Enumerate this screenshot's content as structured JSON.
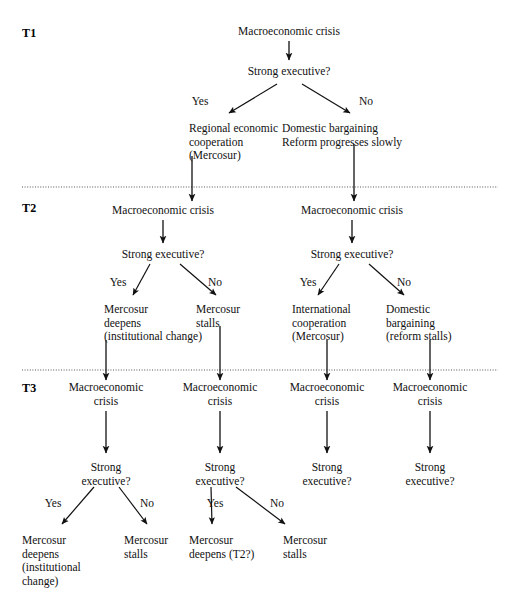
{
  "figure": {
    "type": "decision-tree",
    "title": "",
    "background": "#ffffff",
    "ink": "#111111",
    "divider_color": "#555555"
  },
  "periods": [
    {
      "label": "T1",
      "x": 22,
      "y": 26
    },
    {
      "label": "T2",
      "x": 22,
      "y": 201
    },
    {
      "label": "T3",
      "x": 22,
      "y": 381
    }
  ],
  "dividers": [
    {
      "name": "divider-t1-t2",
      "y": 187
    },
    {
      "name": "divider-t2-t3",
      "y": 370
    }
  ],
  "nodes": [
    {
      "id": "t1-crisis",
      "text": "Macroeconomic crisis",
      "x": 289,
      "y": 25,
      "align": "center"
    },
    {
      "id": "t1-question",
      "text": "Strong executive?",
      "x": 289,
      "y": 65,
      "align": "center"
    },
    {
      "id": "t1-yes-out",
      "text": "Regional economic\ncooperation\n(Mercosur)",
      "x": 189,
      "y": 122,
      "align": "left"
    },
    {
      "id": "t1-no-out",
      "text": "Domestic bargaining\nReform progresses slowly",
      "x": 282,
      "y": 122,
      "align": "left"
    },
    {
      "id": "t2-crisis-l",
      "text": "Macroeconomic crisis",
      "x": 163,
      "y": 204,
      "align": "center"
    },
    {
      "id": "t2-crisis-r",
      "text": "Macroeconomic crisis",
      "x": 352,
      "y": 204,
      "align": "center"
    },
    {
      "id": "t2-question-l",
      "text": "Strong executive?",
      "x": 163,
      "y": 248,
      "align": "center"
    },
    {
      "id": "t2-question-r",
      "text": "Strong executive?",
      "x": 352,
      "y": 248,
      "align": "center"
    },
    {
      "id": "t2-out-ll",
      "text": "Mercosur\ndeepens\n(institutional change)",
      "x": 104,
      "y": 303,
      "align": "left"
    },
    {
      "id": "t2-out-lr",
      "text": "Mercosur\nstalls",
      "x": 196,
      "y": 303,
      "align": "left"
    },
    {
      "id": "t2-out-rl",
      "text": "International\ncooperation\n(Mercosur)",
      "x": 292,
      "y": 303,
      "align": "left"
    },
    {
      "id": "t2-out-rr",
      "text": "Domestic\nbargaining\n(reform stalls)",
      "x": 386,
      "y": 303,
      "align": "left"
    },
    {
      "id": "t3-crisis-1",
      "text": "Macroeconomic\ncrisis",
      "x": 106,
      "y": 381,
      "align": "center"
    },
    {
      "id": "t3-crisis-2",
      "text": "Macroeconomic\ncrisis",
      "x": 220,
      "y": 381,
      "align": "center"
    },
    {
      "id": "t3-crisis-3",
      "text": "Macroeconomic\ncrisis",
      "x": 327,
      "y": 381,
      "align": "center"
    },
    {
      "id": "t3-crisis-4",
      "text": "Macroeconomic\ncrisis",
      "x": 430,
      "y": 381,
      "align": "center"
    },
    {
      "id": "t3-question-1",
      "text": "Strong\nexecutive?",
      "x": 106,
      "y": 461,
      "align": "center"
    },
    {
      "id": "t3-question-2",
      "text": "Strong\nexecutive?",
      "x": 220,
      "y": 461,
      "align": "center"
    },
    {
      "id": "t3-question-3",
      "text": "Strong\nexecutive?",
      "x": 327,
      "y": 461,
      "align": "center"
    },
    {
      "id": "t3-question-4",
      "text": "Strong\nexecutive?",
      "x": 430,
      "y": 461,
      "align": "center"
    },
    {
      "id": "t3-out-1",
      "text": "Mercosur\ndeepens\n(institutional\nchange)",
      "x": 22,
      "y": 534,
      "align": "left"
    },
    {
      "id": "t3-out-2",
      "text": "Mercosur\nstalls",
      "x": 124,
      "y": 534,
      "align": "left"
    },
    {
      "id": "t3-out-3",
      "text": "Mercosur\ndeepens (T2?)",
      "x": 189,
      "y": 534,
      "align": "left"
    },
    {
      "id": "t3-out-4",
      "text": "Mercosur\nstalls",
      "x": 283,
      "y": 534,
      "align": "left"
    }
  ],
  "branch_labels": [
    {
      "id": "t1-yes",
      "text": "Yes",
      "x": 200,
      "y": 95
    },
    {
      "id": "t1-no",
      "text": "No",
      "x": 366,
      "y": 95
    },
    {
      "id": "t2-yes-l",
      "text": "Yes",
      "x": 118,
      "y": 276
    },
    {
      "id": "t2-no-l",
      "text": "No",
      "x": 215,
      "y": 276
    },
    {
      "id": "t2-yes-r",
      "text": "Yes",
      "x": 308,
      "y": 276
    },
    {
      "id": "t2-no-r",
      "text": "No",
      "x": 404,
      "y": 276
    },
    {
      "id": "t3-yes-1",
      "text": "Yes",
      "x": 53,
      "y": 497
    },
    {
      "id": "t3-no-1",
      "text": "No",
      "x": 147,
      "y": 497
    },
    {
      "id": "t3-yes-2",
      "text": "Yes",
      "x": 215,
      "y": 497
    },
    {
      "id": "t3-no-2",
      "text": "No",
      "x": 277,
      "y": 497
    }
  ],
  "arrows": [
    {
      "id": "a-t1-crisis-to-question",
      "x1": 289,
      "y1": 41,
      "x2": 289,
      "y2": 60,
      "kind": "vertical"
    },
    {
      "id": "a-t1-question-yes",
      "x1": 277,
      "y1": 84,
      "x2": 229,
      "y2": 113,
      "kind": "diagonal"
    },
    {
      "id": "a-t1-question-no",
      "x1": 302,
      "y1": 84,
      "x2": 350,
      "y2": 113,
      "kind": "diagonal"
    },
    {
      "id": "a-t1-yes-down",
      "x1": 192,
      "y1": 156,
      "x2": 192,
      "y2": 201,
      "kind": "vertical"
    },
    {
      "id": "a-t1-no-down",
      "x1": 354,
      "y1": 144,
      "x2": 354,
      "y2": 201,
      "kind": "vertical"
    },
    {
      "id": "a-t2-crisis-l",
      "x1": 163,
      "y1": 220,
      "x2": 163,
      "y2": 243,
      "kind": "vertical"
    },
    {
      "id": "a-t2-crisis-r",
      "x1": 352,
      "y1": 220,
      "x2": 352,
      "y2": 243,
      "kind": "vertical"
    },
    {
      "id": "a-t2-yes-l",
      "x1": 150,
      "y1": 264,
      "x2": 133,
      "y2": 295,
      "kind": "diagonal"
    },
    {
      "id": "a-t2-no-l",
      "x1": 180,
      "y1": 264,
      "x2": 216,
      "y2": 295,
      "kind": "diagonal"
    },
    {
      "id": "a-t2-yes-r",
      "x1": 339,
      "y1": 264,
      "x2": 318,
      "y2": 295,
      "kind": "diagonal"
    },
    {
      "id": "a-t2-no-r",
      "x1": 369,
      "y1": 264,
      "x2": 404,
      "y2": 295,
      "kind": "diagonal"
    },
    {
      "id": "a-t2-out-ll-down",
      "x1": 106,
      "y1": 340,
      "x2": 106,
      "y2": 380,
      "kind": "vertical"
    },
    {
      "id": "a-t2-out-lr-down",
      "x1": 220,
      "y1": 326,
      "x2": 220,
      "y2": 380,
      "kind": "vertical"
    },
    {
      "id": "a-t2-out-rl-down",
      "x1": 327,
      "y1": 340,
      "x2": 327,
      "y2": 380,
      "kind": "vertical"
    },
    {
      "id": "a-t2-out-rr-down",
      "x1": 430,
      "y1": 340,
      "x2": 430,
      "y2": 380,
      "kind": "vertical"
    },
    {
      "id": "a-t3-crisis-1",
      "x1": 106,
      "y1": 411,
      "x2": 106,
      "y2": 453,
      "kind": "vertical"
    },
    {
      "id": "a-t3-crisis-2",
      "x1": 220,
      "y1": 411,
      "x2": 220,
      "y2": 453,
      "kind": "vertical"
    },
    {
      "id": "a-t3-crisis-3",
      "x1": 327,
      "y1": 411,
      "x2": 327,
      "y2": 453,
      "kind": "vertical"
    },
    {
      "id": "a-t3-crisis-4",
      "x1": 430,
      "y1": 411,
      "x2": 430,
      "y2": 453,
      "kind": "vertical"
    },
    {
      "id": "a-t3-yes-1",
      "x1": 94,
      "y1": 487,
      "x2": 62,
      "y2": 524,
      "kind": "diagonal"
    },
    {
      "id": "a-t3-no-1",
      "x1": 119,
      "y1": 487,
      "x2": 147,
      "y2": 524,
      "kind": "diagonal"
    },
    {
      "id": "a-t3-yes-2",
      "x1": 211,
      "y1": 487,
      "x2": 212,
      "y2": 524,
      "kind": "diagonal"
    },
    {
      "id": "a-t3-no-2",
      "x1": 236,
      "y1": 487,
      "x2": 285,
      "y2": 524,
      "kind": "diagonal"
    }
  ]
}
